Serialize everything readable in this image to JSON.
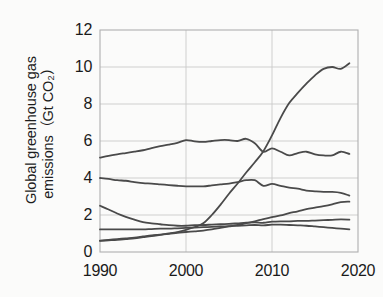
{
  "chart_data": {
    "type": "line",
    "title": "",
    "xlabel": "",
    "ylabel": "Global greenhouse gas emissions（Gt CO₂）",
    "ylabel_line1": "Global greenhouse gas",
    "ylabel_line2": "emissions（Gt CO₂）",
    "xlim": [
      1990,
      2020
    ],
    "ylim": [
      0,
      12
    ],
    "xticks": [
      1990,
      2000,
      2010,
      2020
    ],
    "yticks": [
      0,
      2,
      4,
      6,
      8,
      10,
      12
    ],
    "grid": true,
    "legend": "none",
    "line_color": "#4a4a4a",
    "grid_color": "#c9c9c9",
    "axis_color": "#b0b0b0",
    "x": [
      1990,
      1991,
      1992,
      1993,
      1994,
      1995,
      1996,
      1997,
      1998,
      1999,
      2000,
      2001,
      2002,
      2003,
      2004,
      2005,
      2006,
      2007,
      2008,
      2009,
      2010,
      2011,
      2012,
      2013,
      2014,
      2015,
      2016,
      2017,
      2018,
      2019
    ],
    "series": [
      {
        "name": "steeply-rising-series",
        "values": [
          0.6,
          0.63,
          0.66,
          0.7,
          0.74,
          0.8,
          0.86,
          0.93,
          1.0,
          1.08,
          1.2,
          1.35,
          1.55,
          2.0,
          2.55,
          3.15,
          3.7,
          4.3,
          4.85,
          5.45,
          6.3,
          7.25,
          8.05,
          8.6,
          9.1,
          9.55,
          9.9,
          10.0,
          9.9,
          10.2
        ]
      },
      {
        "name": "high-plateau-declining-series",
        "values": [
          5.1,
          5.2,
          5.28,
          5.35,
          5.42,
          5.5,
          5.62,
          5.72,
          5.8,
          5.9,
          6.05,
          5.98,
          5.95,
          6.0,
          6.05,
          6.05,
          6.0,
          6.12,
          5.88,
          5.42,
          5.6,
          5.42,
          5.22,
          5.35,
          5.42,
          5.28,
          5.22,
          5.22,
          5.42,
          5.3
        ]
      },
      {
        "name": "mid-declining-series",
        "values": [
          4.0,
          3.95,
          3.88,
          3.85,
          3.78,
          3.72,
          3.7,
          3.66,
          3.62,
          3.58,
          3.55,
          3.55,
          3.55,
          3.6,
          3.65,
          3.7,
          3.78,
          3.88,
          3.88,
          3.58,
          3.68,
          3.58,
          3.48,
          3.42,
          3.32,
          3.28,
          3.25,
          3.25,
          3.2,
          3.05
        ]
      },
      {
        "name": "declining-then-rising-series",
        "values": [
          2.5,
          2.3,
          2.08,
          1.9,
          1.75,
          1.62,
          1.55,
          1.5,
          1.45,
          1.42,
          1.42,
          1.45,
          1.46,
          1.48,
          1.5,
          1.52,
          1.55,
          1.58,
          1.6,
          1.58,
          1.64,
          1.66,
          1.66,
          1.68,
          1.68,
          1.7,
          1.72,
          1.74,
          1.76,
          1.75
        ]
      },
      {
        "name": "low-flat-series",
        "values": [
          1.22,
          1.22,
          1.22,
          1.22,
          1.22,
          1.22,
          1.24,
          1.26,
          1.26,
          1.28,
          1.3,
          1.32,
          1.34,
          1.36,
          1.38,
          1.4,
          1.42,
          1.44,
          1.46,
          1.44,
          1.48,
          1.48,
          1.46,
          1.44,
          1.42,
          1.38,
          1.34,
          1.3,
          1.26,
          1.22
        ]
      },
      {
        "name": "steadily-rising-series",
        "values": [
          0.62,
          0.66,
          0.7,
          0.74,
          0.78,
          0.84,
          0.9,
          0.94,
          0.98,
          1.04,
          1.08,
          1.12,
          1.16,
          1.22,
          1.3,
          1.38,
          1.46,
          1.56,
          1.66,
          1.78,
          1.88,
          1.98,
          2.1,
          2.2,
          2.32,
          2.4,
          2.48,
          2.58,
          2.7,
          2.72
        ]
      }
    ]
  }
}
